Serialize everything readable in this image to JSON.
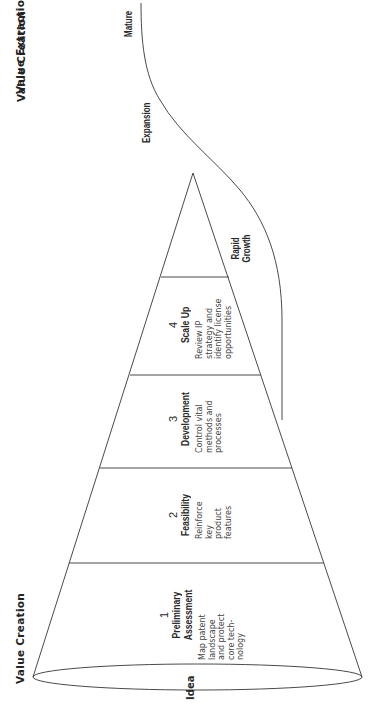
{
  "headers": {
    "value_creation": "Value Creation",
    "value_extraction": "Value Extraction"
  },
  "base_label": "Idea",
  "phases": [
    {
      "number": "1",
      "title_line1": "Preliminary",
      "title_line2": "Assessment",
      "description": [
        "Map patent",
        "landscape",
        "and protect",
        "core tech-",
        "nology"
      ]
    },
    {
      "number": "2",
      "title_line1": "Feasibility",
      "title_line2": "",
      "description": [
        "Reinforce",
        "key",
        "product",
        "features"
      ]
    },
    {
      "number": "3",
      "title_line1": "Development",
      "title_line2": "",
      "description": [
        "Control vital",
        "methods and",
        "processes"
      ]
    },
    {
      "number": "4",
      "title_line1": "Scale Up",
      "title_line2": "",
      "description": [
        "Review IP",
        "strategy and",
        "identify license",
        "opportunities"
      ]
    }
  ],
  "growth_stages": {
    "rapid_growth_line1": "Rapid",
    "rapid_growth_line2": "Growth",
    "expansion": "Expansion",
    "mature": "Mature"
  },
  "colors": {
    "stroke": "#4a4a4a",
    "text": "#2a2a2a",
    "background": "#ffffff"
  }
}
